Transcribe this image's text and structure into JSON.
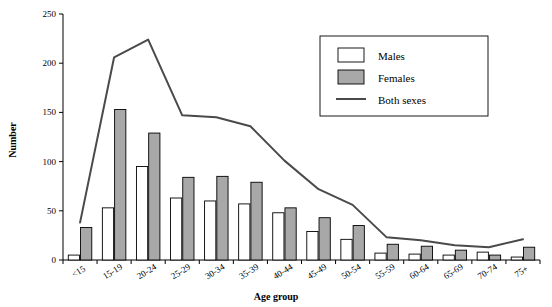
{
  "chart_data": {
    "type": "bar",
    "title": "",
    "xlabel": "Age group",
    "ylabel": "Number",
    "categories": [
      "<15",
      "15-19",
      "20-24",
      "25-29",
      "30-34",
      "35-39",
      "40-44",
      "45-49",
      "50-54",
      "55-59",
      "60-64",
      "65-69",
      "70-74",
      "75+"
    ],
    "yticks": [
      0,
      50,
      100,
      150,
      200,
      250
    ],
    "ylim": [
      0,
      250
    ],
    "grid": false,
    "legend_position": "top-right",
    "series": [
      {
        "name": "Males",
        "type": "bar",
        "values": [
          5,
          53,
          95,
          63,
          60,
          57,
          48,
          29,
          21,
          7,
          6,
          5,
          8,
          3
        ]
      },
      {
        "name": "Females",
        "type": "bar",
        "values": [
          33,
          153,
          129,
          84,
          85,
          79,
          53,
          43,
          35,
          16,
          14,
          10,
          5,
          13
        ]
      },
      {
        "name": "Both sexes",
        "type": "line",
        "values": [
          38,
          206,
          224,
          147,
          145,
          136,
          101,
          72,
          56,
          23,
          20,
          15,
          13,
          21
        ]
      }
    ]
  },
  "legend": {
    "items": [
      {
        "label": "Males",
        "style": "bar-white"
      },
      {
        "label": "Females",
        "style": "bar-gray"
      },
      {
        "label": "Both sexes",
        "style": "line"
      }
    ]
  },
  "axes": {
    "x_title": "Age group",
    "y_title": "Number"
  }
}
